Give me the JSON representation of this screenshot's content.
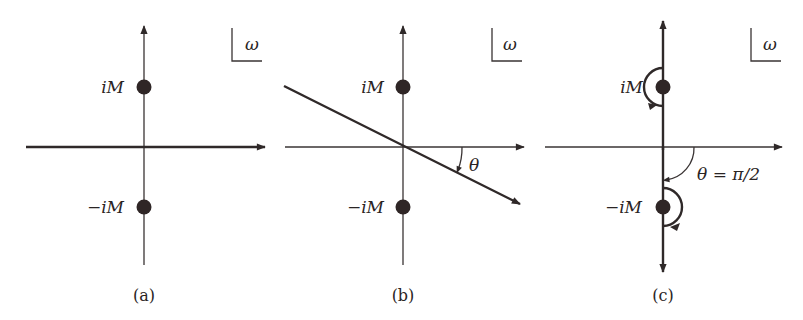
{
  "figure": {
    "panels": [
      {
        "id": "a",
        "caption": "(a)",
        "corner_label": "ω",
        "pole_upper_label": "iM",
        "pole_lower_label": "−iM"
      },
      {
        "id": "b",
        "caption": "(b)",
        "corner_label": "ω",
        "pole_upper_label": "iM",
        "pole_lower_label": "−iM",
        "angle_label": "θ"
      },
      {
        "id": "c",
        "caption": "(c)",
        "corner_label": "ω",
        "pole_upper_label": "iM",
        "pole_lower_label": "−iM",
        "angle_label": "θ = π/2"
      }
    ],
    "colors": {
      "ink": "#2f2929",
      "background": "#ffffff"
    }
  }
}
